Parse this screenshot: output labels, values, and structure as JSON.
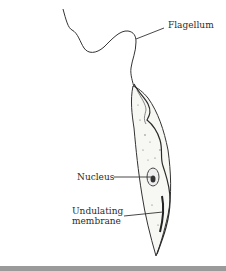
{
  "figure": {
    "labels": {
      "flagellum": "Flagellum",
      "nucleus": "Nucleus",
      "undulating_line1": "Undulating",
      "undulating_line2": "membrane"
    }
  },
  "colors": {
    "background": "#ffffff",
    "ink": "#2a2a2a",
    "bottom_bar": "#9a9a9a"
  }
}
